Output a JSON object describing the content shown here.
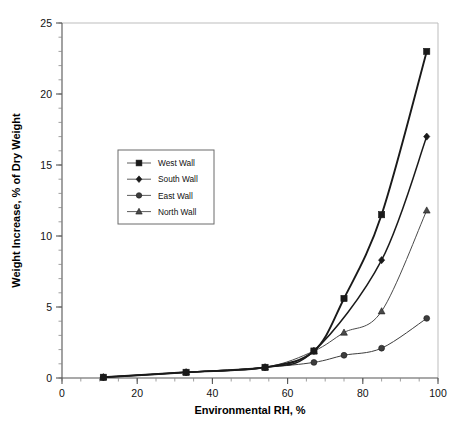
{
  "chart_data": {
    "type": "line",
    "title": "",
    "xlabel": "Environmental RH, %",
    "ylabel": "Weight Increase, % of Dry Weight",
    "xlim": [
      0,
      100
    ],
    "ylim": [
      0,
      25
    ],
    "xticks": [
      0,
      20,
      40,
      60,
      80,
      100
    ],
    "yticks": [
      0,
      5,
      10,
      15,
      20,
      25
    ],
    "xtick_labels": [
      "0",
      "20",
      "40",
      "60",
      "80",
      "100"
    ],
    "ytick_labels": [
      "0",
      "5",
      "10",
      "15",
      "20",
      "25"
    ],
    "x_minor_step": 5,
    "y_minor_step": 1,
    "grid": false,
    "legend_position": "center-left",
    "series": [
      {
        "name": "West Wall",
        "marker": "square",
        "color": "#1a1a1a",
        "line_width": 1.9,
        "x": [
          11,
          33,
          54,
          67,
          75,
          85,
          97
        ],
        "y": [
          0.05,
          0.4,
          0.75,
          1.9,
          5.6,
          11.5,
          23.0
        ]
      },
      {
        "name": "South Wall",
        "marker": "diamond",
        "color": "#1a1a1a",
        "line_width": 1.5,
        "x": [
          11,
          33,
          54,
          67,
          85,
          97
        ],
        "y": [
          0.05,
          0.4,
          0.75,
          1.9,
          8.3,
          17.0
        ]
      },
      {
        "name": "East Wall",
        "marker": "circle",
        "color": "#3d3d3d",
        "line_width": 1.0,
        "x": [
          11,
          33,
          54,
          67,
          75,
          85,
          97
        ],
        "y": [
          0.05,
          0.4,
          0.75,
          1.1,
          1.6,
          2.1,
          4.2
        ]
      },
      {
        "name": "North Wall",
        "marker": "triangle",
        "color": "#4a4a4a",
        "line_width": 1.0,
        "x": [
          11,
          33,
          54,
          67,
          75,
          85,
          97
        ],
        "y": [
          0.05,
          0.4,
          0.75,
          1.9,
          3.2,
          4.7,
          11.8
        ]
      }
    ]
  },
  "legend": {
    "items": [
      {
        "label": "West Wall"
      },
      {
        "label": "South Wall"
      },
      {
        "label": "East Wall"
      },
      {
        "label": "North Wall"
      }
    ]
  },
  "axes": {
    "x_title": "Environmental RH, %",
    "y_title": "Weight Increase, % of Dry Weight"
  }
}
